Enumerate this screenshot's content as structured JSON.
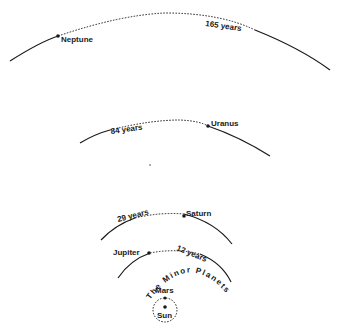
{
  "diagram": {
    "background": "#ffffff",
    "ink": "#1a1a1a",
    "orbits": [
      {
        "name": "Neptune",
        "period_label": "165 years"
      },
      {
        "name": "Uranus",
        "period_label": "84 years"
      },
      {
        "name": "Saturn",
        "period_label": "29 years"
      },
      {
        "name": "Jupiter",
        "period_label": "12 years"
      },
      {
        "name": "Mars"
      }
    ],
    "belt_label": "The Minor Planets",
    "center_label": "Sun"
  }
}
